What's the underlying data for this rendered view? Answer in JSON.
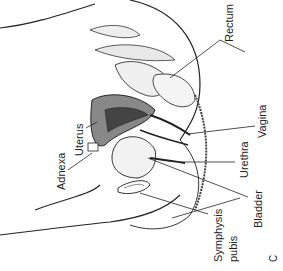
{
  "figure": {
    "panel_letter": "C",
    "labels": {
      "rectum": "Rectum",
      "vagina": "Vagina",
      "urethra": "Urethra",
      "bladder": "Bladder",
      "symphysis_pubis_line1": "Symphysis",
      "symphysis_pubis_line2": "pubis",
      "uterus": "Uterus",
      "adnexa": "Adnexa"
    }
  }
}
